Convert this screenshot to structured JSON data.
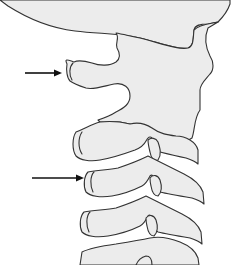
{
  "figure": {
    "colors": {
      "background": "#ffffff",
      "bone_fill": "#ececec",
      "outline": "#333333",
      "arrow": "#111111"
    },
    "arrows": [
      {
        "name": "upper-arrow",
        "from": [
          25,
          73
        ],
        "to": [
          60,
          73
        ]
      },
      {
        "name": "lower-arrow",
        "from": [
          32,
          178
        ],
        "to": [
          82,
          178
        ]
      }
    ]
  }
}
